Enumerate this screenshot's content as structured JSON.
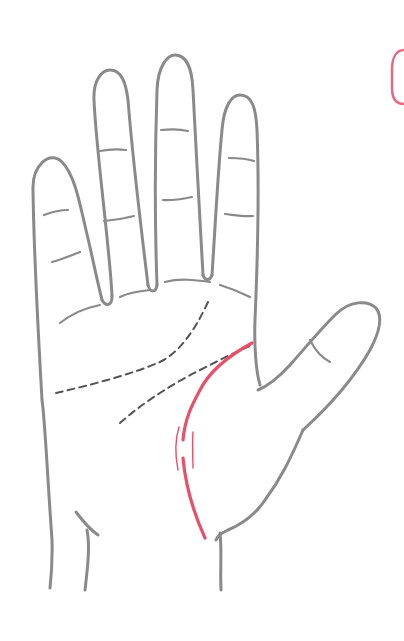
{
  "illustration": {
    "subject": "palm-of-hand",
    "colors": {
      "background": "#ffffff",
      "outline": "#8a8a8a",
      "minor_lines": "#555555",
      "highlight_line": "#e8506a",
      "corner_badge": "#e46a82"
    },
    "highlighted_line": "life-line",
    "highlighted_line_features": [
      "break",
      "parallel-sister-lines"
    ],
    "dashed_lines": [
      "heart-line",
      "head-line",
      "short-branch"
    ]
  }
}
